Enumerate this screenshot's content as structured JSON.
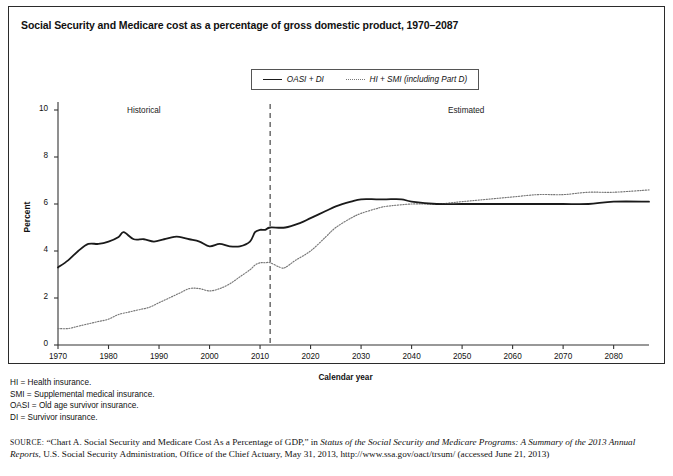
{
  "figure": {
    "title": "Social Security and Medicare cost as a percentage of gross domestic product, 1970–2087"
  },
  "legend": {
    "position": "top-center",
    "items": [
      {
        "label": "OASI + DI",
        "style": "solid",
        "color": "#1a1a1a"
      },
      {
        "label": "HI + SMI (including Part D)",
        "style": "dotted",
        "color": "#777777"
      }
    ]
  },
  "annotations": {
    "historical": "Historical",
    "estimated": "Estimated",
    "divider_year": 2012
  },
  "axes": {
    "ylabel": "Percent",
    "xlabel": "Calendar year",
    "yticks": [
      "10",
      "8",
      "6",
      "4",
      "2",
      "0"
    ],
    "xticks": [
      "1970",
      "1980",
      "1990",
      "2000",
      "2010",
      "2020",
      "2030",
      "2040",
      "2050",
      "2060",
      "2070",
      "2080"
    ]
  },
  "notes": [
    "HI = Health insurance.",
    "SMI = Supplemental medical insurance.",
    "OASI = Old age survivor insurance.",
    "DI = Survivor insurance."
  ],
  "source": {
    "label": "source:",
    "text_1": "“Chart A. Social Security and Medicare Cost As a Percentage of GDP,” in ",
    "italic_1": "Status of the Social Security and Medicare Programs: A Summary of the 2013 Annual Reports",
    "text_2": ", U.S. Social Security Administration, Office of the Chief Actuary, May 31, 2013, http://www.ssa.gov/oact/trsum/ (accessed June 21, 2013)"
  },
  "chart_data": {
    "type": "line",
    "title": "Social Security and Medicare cost as a percentage of gross domestic product, 1970–2087",
    "xlabel": "Calendar year",
    "ylabel": "Percent",
    "xlim": [
      1970,
      2087
    ],
    "ylim": [
      0,
      10
    ],
    "grid": false,
    "legend_position": "top-center",
    "divider_year": 2012,
    "divider_style": "dashed-vertical",
    "series": [
      {
        "name": "OASI + DI",
        "style": "solid",
        "color": "#1a1a1a",
        "x": [
          1970,
          1972,
          1974,
          1976,
          1978,
          1980,
          1982,
          1983,
          1985,
          1987,
          1989,
          1991,
          1993,
          1994,
          1996,
          1998,
          2000,
          2002,
          2004,
          2006,
          2008,
          2009,
          2010,
          2011,
          2012,
          2015,
          2018,
          2020,
          2023,
          2025,
          2028,
          2030,
          2033,
          2035,
          2038,
          2040,
          2045,
          2050,
          2055,
          2060,
          2065,
          2070,
          2075,
          2080,
          2087
        ],
        "y": [
          3.3,
          3.6,
          4.0,
          4.3,
          4.3,
          4.4,
          4.6,
          4.8,
          4.5,
          4.5,
          4.4,
          4.5,
          4.6,
          4.6,
          4.5,
          4.4,
          4.2,
          4.3,
          4.2,
          4.2,
          4.4,
          4.8,
          4.9,
          4.9,
          5.0,
          5.0,
          5.2,
          5.4,
          5.7,
          5.9,
          6.1,
          6.2,
          6.2,
          6.2,
          6.2,
          6.1,
          6.0,
          6.0,
          6.0,
          6.0,
          6.0,
          6.0,
          6.0,
          6.1,
          6.1
        ]
      },
      {
        "name": "HI + SMI (including Part D)",
        "style": "dotted",
        "color": "#777777",
        "x": [
          1970,
          1972,
          1974,
          1976,
          1978,
          1980,
          1982,
          1984,
          1986,
          1988,
          1990,
          1992,
          1994,
          1996,
          1998,
          2000,
          2002,
          2004,
          2006,
          2008,
          2009,
          2010,
          2011,
          2012,
          2014,
          2015,
          2017,
          2020,
          2023,
          2025,
          2028,
          2030,
          2033,
          2035,
          2040,
          2045,
          2050,
          2055,
          2060,
          2065,
          2070,
          2075,
          2080,
          2087
        ],
        "y": [
          0.7,
          0.7,
          0.8,
          0.9,
          1.0,
          1.1,
          1.3,
          1.4,
          1.5,
          1.6,
          1.8,
          2.0,
          2.2,
          2.4,
          2.4,
          2.3,
          2.4,
          2.6,
          2.9,
          3.2,
          3.4,
          3.5,
          3.5,
          3.5,
          3.3,
          3.3,
          3.6,
          4.0,
          4.6,
          5.0,
          5.4,
          5.6,
          5.8,
          5.9,
          6.0,
          6.0,
          6.1,
          6.2,
          6.3,
          6.4,
          6.4,
          6.5,
          6.5,
          6.6
        ]
      }
    ]
  }
}
